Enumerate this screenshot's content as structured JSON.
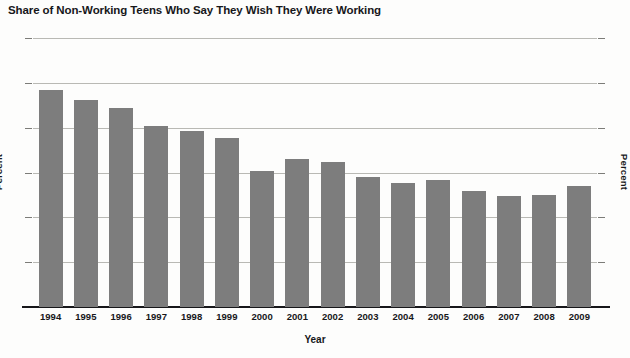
{
  "chart_data": {
    "type": "bar",
    "title": "Share of Non-Working Teens Who Say They Wish They Were Working",
    "xlabel": "Year",
    "ylabel": "Percent",
    "ylabel_right": "Percent",
    "ylim": [
      0,
      30
    ],
    "yticks": [
      0,
      5,
      10,
      15,
      20,
      25,
      30
    ],
    "ytick_labels": [
      "0",
      "5",
      "10",
      "15",
      "20",
      "25",
      "30"
    ],
    "grid": true,
    "legend": "none",
    "bar_color": "#7d7d7d",
    "categories": [
      "1994",
      "1995",
      "1996",
      "1997",
      "1998",
      "1999",
      "2000",
      "2001",
      "2002",
      "2003",
      "2004",
      "2005",
      "2006",
      "2007",
      "2008",
      "2009"
    ],
    "values": [
      24.2,
      23.1,
      22.2,
      20.2,
      19.6,
      18.9,
      15.2,
      16.5,
      16.2,
      14.5,
      13.8,
      14.2,
      12.9,
      12.4,
      12.5,
      13.5
    ]
  },
  "colors": {
    "bar": "#7d7d7d",
    "gridline": "#b9b9b4",
    "axis": "#17171a",
    "background": "#fdfdfc"
  }
}
